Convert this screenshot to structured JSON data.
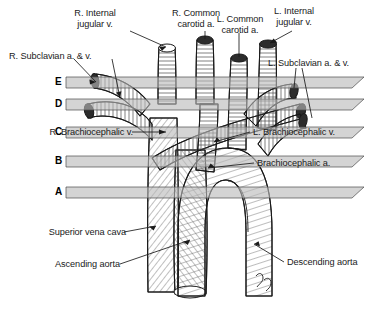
{
  "figure": {
    "background_color": "#ffffff",
    "ink_color": "#1a1a1a",
    "band_color": "#b9b9b9"
  },
  "labels": {
    "r_internal_jugular": "R. Internal\njugular v.",
    "r_common_carotid": "R. Common\ncarotid a.",
    "l_common_carotid": "L. Common\ncarotid a.",
    "l_internal_jugular": "L. Internal\njugular v.",
    "r_subclavian": "R. Subclavian a. & v.",
    "l_subclavian": "L. Subclavian a. & v.",
    "r_brachiocephalic_v": "R. Brachiocephalic v.",
    "l_brachiocephalic_v": "L. Brachiocephalic v.",
    "brachiocephalic_a": "Brachiocephalic a.",
    "superior_vena_cava": "Superior vena cava",
    "ascending_aorta": "Ascending aorta",
    "descending_aorta": "Descending aorta"
  },
  "section_levels": [
    {
      "id": "E",
      "letter": "E",
      "y": 82
    },
    {
      "id": "D",
      "letter": "D",
      "y": 104
    },
    {
      "id": "C",
      "letter": "C",
      "y": 132
    },
    {
      "id": "B",
      "letter": "B",
      "y": 161
    },
    {
      "id": "A",
      "letter": "A",
      "y": 192
    }
  ]
}
